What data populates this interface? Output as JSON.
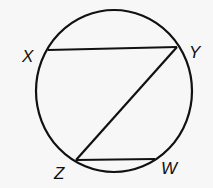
{
  "diagram": {
    "type": "circle-chords",
    "circle": {
      "cx": 114,
      "cy": 91,
      "rx": 78,
      "ry": 81
    },
    "points": [
      {
        "name": "X",
        "x": 48,
        "y": 50,
        "label_x": 22,
        "label_y": 62
      },
      {
        "name": "Y",
        "x": 177,
        "y": 47,
        "label_x": 189,
        "label_y": 58
      },
      {
        "name": "Z",
        "x": 76,
        "y": 160,
        "label_x": 54,
        "label_y": 179
      },
      {
        "name": "W",
        "x": 155,
        "y": 159,
        "label_x": 161,
        "label_y": 174
      }
    ],
    "segments": [
      {
        "from": "X",
        "to": "Y"
      },
      {
        "from": "Y",
        "to": "Z"
      },
      {
        "from": "Z",
        "to": "W"
      }
    ],
    "stroke_color": "#111111",
    "background_color": "#f7f7f7"
  }
}
